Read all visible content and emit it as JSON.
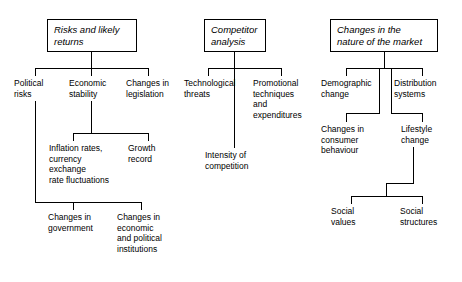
{
  "diagram": {
    "line_color": "#000000",
    "background_color": "#ffffff",
    "branches": [
      {
        "root": "Risks and likely\nreturns",
        "children": [
          "Political\nrisks",
          "Economic\nstability",
          "Changes in\nlegislation"
        ],
        "grandchildren": [
          "Inflation rates,\ncurrency\nexchange\nrate fluctuations",
          "Growth\nrecord",
          "Changes in\ngovernment",
          "Changes in\neconomic\nand political\ninstitutions"
        ]
      },
      {
        "root": "Competitor\nanalysis",
        "children": [
          "Technological\nthreats",
          "Promotional\ntechniques\nand\nexpenditures"
        ],
        "grandchildren": [
          "Intensity of\ncompetition"
        ]
      },
      {
        "root": "Changes in the\nnature of the market",
        "children": [
          "Demographic\nchange",
          "Distribution\nsystems"
        ],
        "grandchildren": [
          "Changes in\nconsumer\nbehaviour",
          "Lifestyle\nchange",
          "Social\nvalues",
          "Social\nstructures"
        ]
      }
    ]
  },
  "nodes": {
    "risks_root": "Risks and likely\nreturns",
    "political_risks": "Political\nrisks",
    "economic_stability": "Economic\nstability",
    "changes_legislation": "Changes in\nlegislation",
    "inflation_rates": "Inflation rates,\ncurrency\nexchange\nrate fluctuations",
    "growth_record": "Growth\nrecord",
    "changes_government": "Changes in\ngovernment",
    "changes_institutions": "Changes in\neconomic\nand political\ninstitutions",
    "competitor_root": "Competitor\nanalysis",
    "technological_threats": "Technological\nthreats",
    "promotional_techniques": "Promotional\ntechniques\nand\nexpenditures",
    "intensity_competition": "Intensity of\ncompetition",
    "market_root": "Changes in the\nnature of the market",
    "demographic_change": "Demographic\nchange",
    "distribution_systems": "Distribution\nsystems",
    "consumer_behaviour": "Changes in\nconsumer\nbehaviour",
    "lifestyle_change": "Lifestyle\nchange",
    "social_values": "Social\nvalues",
    "social_structures": "Social\nstructures"
  }
}
